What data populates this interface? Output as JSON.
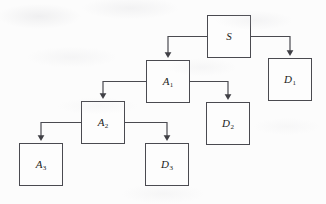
{
  "diagram": {
    "type": "tree-flowchart",
    "title": "",
    "background_color": "#fcfcfc",
    "box_border_color": "#4a4a50",
    "connector_color": "#4a4a50",
    "label_color": "#1c1c20",
    "nodes": [
      {
        "id": "S",
        "base": "S",
        "subscript": "",
        "x": 207,
        "y": 15,
        "width": 44,
        "height": 43
      },
      {
        "id": "D1",
        "base": "D",
        "subscript": "1",
        "x": 268,
        "y": 58,
        "width": 44,
        "height": 43
      },
      {
        "id": "A1",
        "base": "A",
        "subscript": "1",
        "x": 146,
        "y": 60,
        "width": 44,
        "height": 43
      },
      {
        "id": "D2",
        "base": "D",
        "subscript": "2",
        "x": 206,
        "y": 102,
        "width": 44,
        "height": 43
      },
      {
        "id": "A2",
        "base": "A",
        "subscript": "2",
        "x": 81,
        "y": 101,
        "width": 44,
        "height": 43
      },
      {
        "id": "D3",
        "base": "D",
        "subscript": "3",
        "x": 145,
        "y": 143,
        "width": 44,
        "height": 43
      },
      {
        "id": "A3",
        "base": "A",
        "subscript": "3",
        "x": 19,
        "y": 143,
        "width": 44,
        "height": 43
      }
    ],
    "edges": [
      {
        "id": "S-to-A1",
        "from": "S",
        "to": "A1",
        "direction": "left-down"
      },
      {
        "id": "S-to-D1",
        "from": "S",
        "to": "D1",
        "direction": "right-down"
      },
      {
        "id": "A1-to-A2",
        "from": "A1",
        "to": "A2",
        "direction": "left-down"
      },
      {
        "id": "A1-to-D2",
        "from": "A1",
        "to": "D2",
        "direction": "right-down"
      },
      {
        "id": "A2-to-A3",
        "from": "A2",
        "to": "A3",
        "direction": "left-down"
      },
      {
        "id": "A2-to-D3",
        "from": "A2",
        "to": "D3",
        "direction": "right-down"
      }
    ]
  }
}
